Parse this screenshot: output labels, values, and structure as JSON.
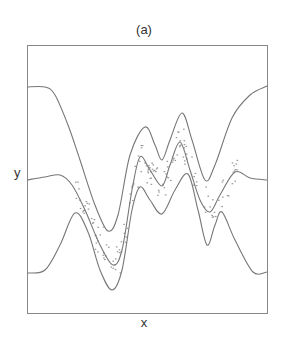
{
  "chart_data": {
    "type": "line",
    "title": "(a)",
    "xlabel": "x",
    "ylabel": "y",
    "grid": false,
    "legend": null,
    "axis_ticks": false,
    "frame": {
      "x0": 27,
      "y0": 45,
      "x1": 267,
      "y1": 313
    },
    "colors": {
      "curve": "#777777",
      "frame": "#888888",
      "points": "#999999"
    },
    "series": [
      {
        "name": "upper-band",
        "points": [
          [
            27,
            87
          ],
          [
            45,
            87
          ],
          [
            55,
            95
          ],
          [
            68,
            125
          ],
          [
            80,
            160
          ],
          [
            95,
            205
          ],
          [
            108,
            231
          ],
          [
            118,
            215
          ],
          [
            130,
            155
          ],
          [
            145,
            127
          ],
          [
            155,
            145
          ],
          [
            162,
            160
          ],
          [
            170,
            140
          ],
          [
            182,
            113
          ],
          [
            192,
            140
          ],
          [
            205,
            180
          ],
          [
            215,
            165
          ],
          [
            232,
            118
          ],
          [
            250,
            95
          ],
          [
            267,
            86
          ]
        ]
      },
      {
        "name": "mean",
        "points": [
          [
            27,
            180
          ],
          [
            45,
            177
          ],
          [
            60,
            175
          ],
          [
            72,
            185
          ],
          [
            85,
            210
          ],
          [
            100,
            245
          ],
          [
            113,
            265
          ],
          [
            122,
            250
          ],
          [
            132,
            190
          ],
          [
            140,
            157
          ],
          [
            150,
            170
          ],
          [
            162,
            186
          ],
          [
            170,
            165
          ],
          [
            180,
            142
          ],
          [
            190,
            170
          ],
          [
            200,
            200
          ],
          [
            210,
            212
          ],
          [
            220,
            195
          ],
          [
            235,
            172
          ],
          [
            250,
            178
          ],
          [
            267,
            180
          ]
        ]
      },
      {
        "name": "lower-band",
        "points": [
          [
            27,
            273
          ],
          [
            45,
            270
          ],
          [
            60,
            245
          ],
          [
            75,
            213
          ],
          [
            88,
            232
          ],
          [
            100,
            270
          ],
          [
            112,
            290
          ],
          [
            122,
            270
          ],
          [
            132,
            210
          ],
          [
            140,
            187
          ],
          [
            150,
            200
          ],
          [
            162,
            214
          ],
          [
            175,
            190
          ],
          [
            188,
            174
          ],
          [
            198,
            210
          ],
          [
            207,
            245
          ],
          [
            215,
            225
          ],
          [
            222,
            212
          ],
          [
            235,
            240
          ],
          [
            253,
            272
          ],
          [
            267,
            272
          ]
        ]
      }
    ],
    "scatter": {
      "name": "observations",
      "x_range": [
        75,
        240
      ],
      "n": 160,
      "spread": 12
    }
  }
}
